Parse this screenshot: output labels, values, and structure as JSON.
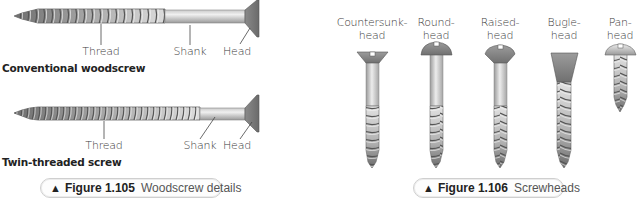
{
  "figure_105": {
    "screws": [
      {
        "name": "Conventional woodscrew",
        "labels": {
          "thread": "Thread",
          "shank": "Shank",
          "head": "Head"
        }
      },
      {
        "name": "Twin-threaded screw",
        "labels": {
          "thread": "Thread",
          "shank": "Shank",
          "head": "Head"
        }
      }
    ],
    "caption": {
      "marker": "▲",
      "number": "Figure 1.105",
      "title": "Woodscrew details"
    }
  },
  "figure_106": {
    "heads": [
      {
        "line1": "Countersunk-",
        "line2": "head"
      },
      {
        "line1": "Round-",
        "line2": "head"
      },
      {
        "line1": "Raised-",
        "line2": "head"
      },
      {
        "line1": "Bugle-",
        "line2": "head"
      },
      {
        "line1": "Pan-",
        "line2": "head"
      }
    ],
    "caption": {
      "marker": "▲",
      "number": "Figure 1.106",
      "title": "Screwheads"
    }
  },
  "colors": {
    "metal_light": "#e6e6e6",
    "metal_mid": "#b8b8b8",
    "metal_dark": "#7a7a7a",
    "caption_border": "#cfcfcf"
  }
}
